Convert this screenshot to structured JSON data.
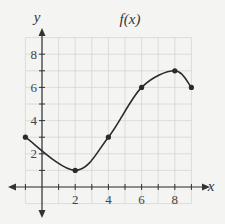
{
  "chart_data": {
    "type": "line",
    "title": "f(x)",
    "xlabel": "x",
    "ylabel": "y",
    "xlim": [
      -1,
      9
    ],
    "ylim": [
      -1,
      9
    ],
    "grid": true,
    "x_ticks": [
      2,
      4,
      6,
      8
    ],
    "y_ticks": [
      2,
      4,
      6,
      8
    ],
    "x_tick_labels": [
      "2",
      "4",
      "6",
      "8"
    ],
    "y_tick_labels": [
      "2",
      "4",
      "6",
      "8"
    ],
    "series": [
      {
        "name": "f(x)",
        "smooth": true,
        "points": [
          {
            "x": -1,
            "y": 3
          },
          {
            "x": 2,
            "y": 1
          },
          {
            "x": 4,
            "y": 3
          },
          {
            "x": 6,
            "y": 6
          },
          {
            "x": 8,
            "y": 7
          },
          {
            "x": 9,
            "y": 6
          }
        ],
        "marked_points": [
          {
            "x": -1,
            "y": 3
          },
          {
            "x": 2,
            "y": 1
          },
          {
            "x": 4,
            "y": 3
          },
          {
            "x": 6,
            "y": 6
          },
          {
            "x": 8,
            "y": 7
          },
          {
            "x": 9,
            "y": 6
          }
        ]
      }
    ],
    "legend": null
  },
  "colors": {
    "background": "#f4f4f3",
    "grid": "#d6d6d6",
    "axis": "#333333",
    "curve": "#2b2b2b"
  }
}
